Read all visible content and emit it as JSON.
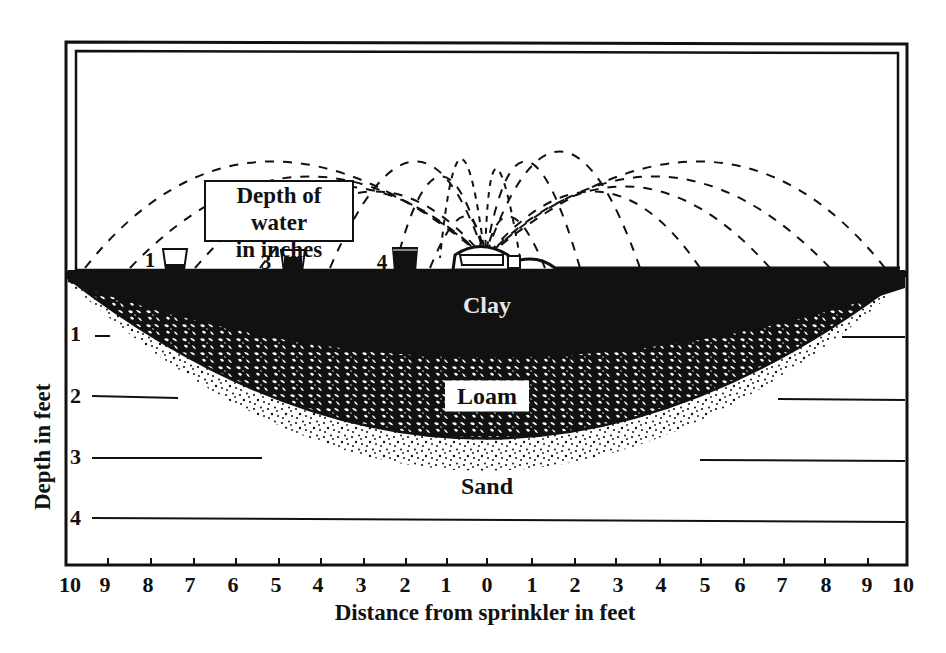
{
  "diagram": {
    "legend_box": {
      "line1": "Depth of water",
      "line2": "in inches"
    },
    "rain_gauges": [
      {
        "label": "1",
        "x_feet": -7.5,
        "fill_level": "low"
      },
      {
        "label": "3",
        "x_feet": -4.5,
        "fill_level": "medium"
      },
      {
        "label": "4",
        "x_feet": -2,
        "fill_level": "full"
      }
    ],
    "sprinkler": {
      "label": "",
      "x_feet": 0
    },
    "soil_layers": [
      {
        "name": "Clay",
        "max_depth_feet": 1.3,
        "pattern": "solid-black"
      },
      {
        "name": "Loam",
        "max_depth_feet": 2.7,
        "pattern": "mottled"
      },
      {
        "name": "Sand",
        "max_depth_feet": 4.3,
        "pattern": "stippled"
      }
    ],
    "x_axis": {
      "label": "Distance from sprinkler in feet",
      "ticks": [
        "10",
        "9",
        "8",
        "7",
        "6",
        "5",
        "4",
        "3",
        "2",
        "1",
        "0",
        "1",
        "2",
        "3",
        "4",
        "5",
        "6",
        "7",
        "8",
        "9",
        "10"
      ]
    },
    "y_axis": {
      "label": "Depth in feet",
      "ticks": [
        "1",
        "2",
        "3",
        "4"
      ]
    },
    "colors": {
      "ink": "#111111",
      "paper": "#ffffff",
      "clay_text": "#e8e8e8"
    }
  }
}
